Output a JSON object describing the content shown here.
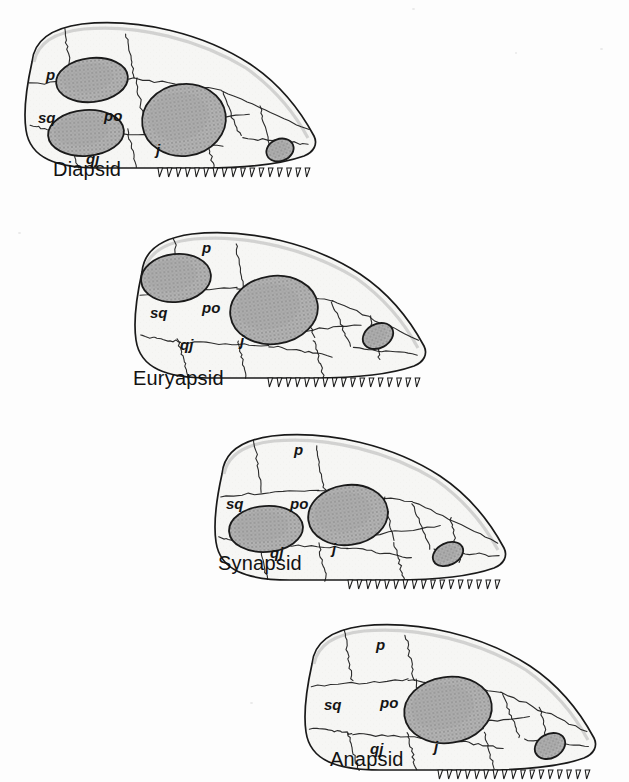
{
  "figure": {
    "background_color": "#fdfdfd",
    "ink_color": "#1a1a1a",
    "bone_fill_color": "#f6f6f4",
    "opening_fill_color": "#b3b3b3",
    "opening_stipple_color": "#6a6a6a",
    "view": "lateral, snout to the right"
  },
  "bone_label_glossary": {
    "p": "parietal",
    "sq": "squamosal",
    "po": "postorbital",
    "qj": "quadratojugal",
    "j": "jugal"
  },
  "skulls": [
    {
      "id": "diapsid",
      "caption": "Diapsid",
      "caption_x": 53,
      "caption_y": 158,
      "origin_x": 8,
      "origin_y": 18,
      "fenestra_count": 2,
      "openings": [
        {
          "name": "upper-temporal-fenestra",
          "cx": 84,
          "cy": 62,
          "rx": 36,
          "ry": 22,
          "rot": -6
        },
        {
          "name": "lower-temporal-fenestra",
          "cx": 78,
          "cy": 115,
          "rx": 38,
          "ry": 23,
          "rot": -4
        },
        {
          "name": "orbit",
          "cx": 176,
          "cy": 102,
          "rx": 42,
          "ry": 36,
          "rot": -8
        },
        {
          "name": "external-naris",
          "cx": 272,
          "cy": 132,
          "rx": 14,
          "ry": 11,
          "rot": -22
        }
      ],
      "labels": [
        {
          "text": "p",
          "x": 38,
          "y": 62
        },
        {
          "text": "sq",
          "x": 30,
          "y": 105
        },
        {
          "text": "po",
          "x": 96,
          "y": 103
        },
        {
          "text": "qj",
          "x": 78,
          "y": 146
        },
        {
          "text": "j",
          "x": 148,
          "y": 137
        }
      ]
    },
    {
      "id": "euryapsid",
      "caption": "Euryapsid",
      "caption_x": 133,
      "caption_y": 367,
      "origin_x": 118,
      "origin_y": 228,
      "fenestra_count": 1,
      "openings": [
        {
          "name": "upper-temporal-fenestra",
          "cx": 58,
          "cy": 50,
          "rx": 35,
          "ry": 24,
          "rot": -6
        },
        {
          "name": "orbit",
          "cx": 156,
          "cy": 82,
          "rx": 44,
          "ry": 34,
          "rot": -8
        },
        {
          "name": "external-naris",
          "cx": 260,
          "cy": 108,
          "rx": 16,
          "ry": 12,
          "rot": -28
        }
      ],
      "labels": [
        {
          "text": "p",
          "x": 84,
          "y": 25
        },
        {
          "text": "sq",
          "x": 32,
          "y": 90
        },
        {
          "text": "po",
          "x": 84,
          "y": 85
        },
        {
          "text": "qj",
          "x": 62,
          "y": 122
        },
        {
          "text": "j",
          "x": 122,
          "y": 118
        }
      ]
    },
    {
      "id": "synapsid",
      "caption": "Synapsid",
      "caption_x": 218,
      "caption_y": 552,
      "origin_x": 198,
      "origin_y": 430,
      "fenestra_count": 1,
      "openings": [
        {
          "name": "lower-temporal-fenestra",
          "cx": 68,
          "cy": 99,
          "rx": 37,
          "ry": 23,
          "rot": -4
        },
        {
          "name": "orbit",
          "cx": 150,
          "cy": 85,
          "rx": 40,
          "ry": 30,
          "rot": -8
        },
        {
          "name": "external-naris",
          "cx": 250,
          "cy": 124,
          "rx": 16,
          "ry": 11,
          "rot": -26
        }
      ],
      "labels": [
        {
          "text": "p",
          "x": 96,
          "y": 25
        },
        {
          "text": "sq",
          "x": 28,
          "y": 79
        },
        {
          "text": "po",
          "x": 92,
          "y": 79
        },
        {
          "text": "qj",
          "x": 72,
          "y": 128
        },
        {
          "text": "j",
          "x": 134,
          "y": 124
        }
      ]
    },
    {
      "id": "anapsid",
      "caption": "Anapsid",
      "caption_x": 330,
      "caption_y": 748,
      "origin_x": 288,
      "origin_y": 620,
      "fenestra_count": 0,
      "openings": [
        {
          "name": "orbit",
          "cx": 160,
          "cy": 90,
          "rx": 44,
          "ry": 33,
          "rot": -8
        },
        {
          "name": "external-naris",
          "cx": 262,
          "cy": 126,
          "rx": 16,
          "ry": 12,
          "rot": -28
        }
      ],
      "labels": [
        {
          "text": "p",
          "x": 88,
          "y": 30
        },
        {
          "text": "sq",
          "x": 36,
          "y": 90
        },
        {
          "text": "po",
          "x": 92,
          "y": 88
        },
        {
          "text": "qj",
          "x": 82,
          "y": 134
        },
        {
          "text": "j",
          "x": 146,
          "y": 132
        }
      ]
    }
  ]
}
